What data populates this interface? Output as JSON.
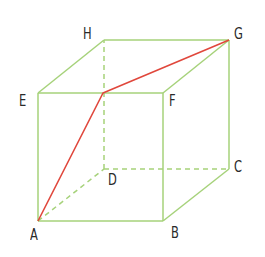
{
  "diagram": {
    "type": "cube",
    "colors": {
      "edge": "#a6d27a",
      "path": "#e0473c",
      "label": "#2a2a2a",
      "background": "#ffffff"
    },
    "vertices": {
      "A": {
        "label": "A",
        "x": 38,
        "y": 221,
        "label_x": 30,
        "label_y": 228
      },
      "B": {
        "label": "B",
        "x": 163,
        "y": 221,
        "label_x": 171,
        "label_y": 226
      },
      "C": {
        "label": "C",
        "x": 229,
        "y": 169,
        "label_x": 234,
        "label_y": 160
      },
      "D": {
        "label": "D",
        "x": 104,
        "y": 169,
        "label_x": 108,
        "label_y": 173
      },
      "E": {
        "label": "E",
        "x": 38,
        "y": 93,
        "label_x": 19,
        "label_y": 94
      },
      "F": {
        "label": "F",
        "x": 163,
        "y": 93,
        "label_x": 169,
        "label_y": 94
      },
      "G": {
        "label": "G",
        "x": 229,
        "y": 40,
        "label_x": 234,
        "label_y": 27
      },
      "H": {
        "label": "H",
        "x": 104,
        "y": 40,
        "label_x": 83,
        "label_y": 27
      }
    },
    "solid_edges": [
      "AB",
      "BF",
      "FE",
      "EA",
      "EH",
      "HG",
      "GF",
      "GC",
      "CB"
    ],
    "dashed_edges": [
      "AD",
      "DC",
      "DH"
    ],
    "path": {
      "description": "Shortest path from A to G across faces via a point on EF",
      "points": [
        [
          38,
          221
        ],
        [
          103,
          93
        ],
        [
          229,
          40
        ]
      ]
    }
  }
}
